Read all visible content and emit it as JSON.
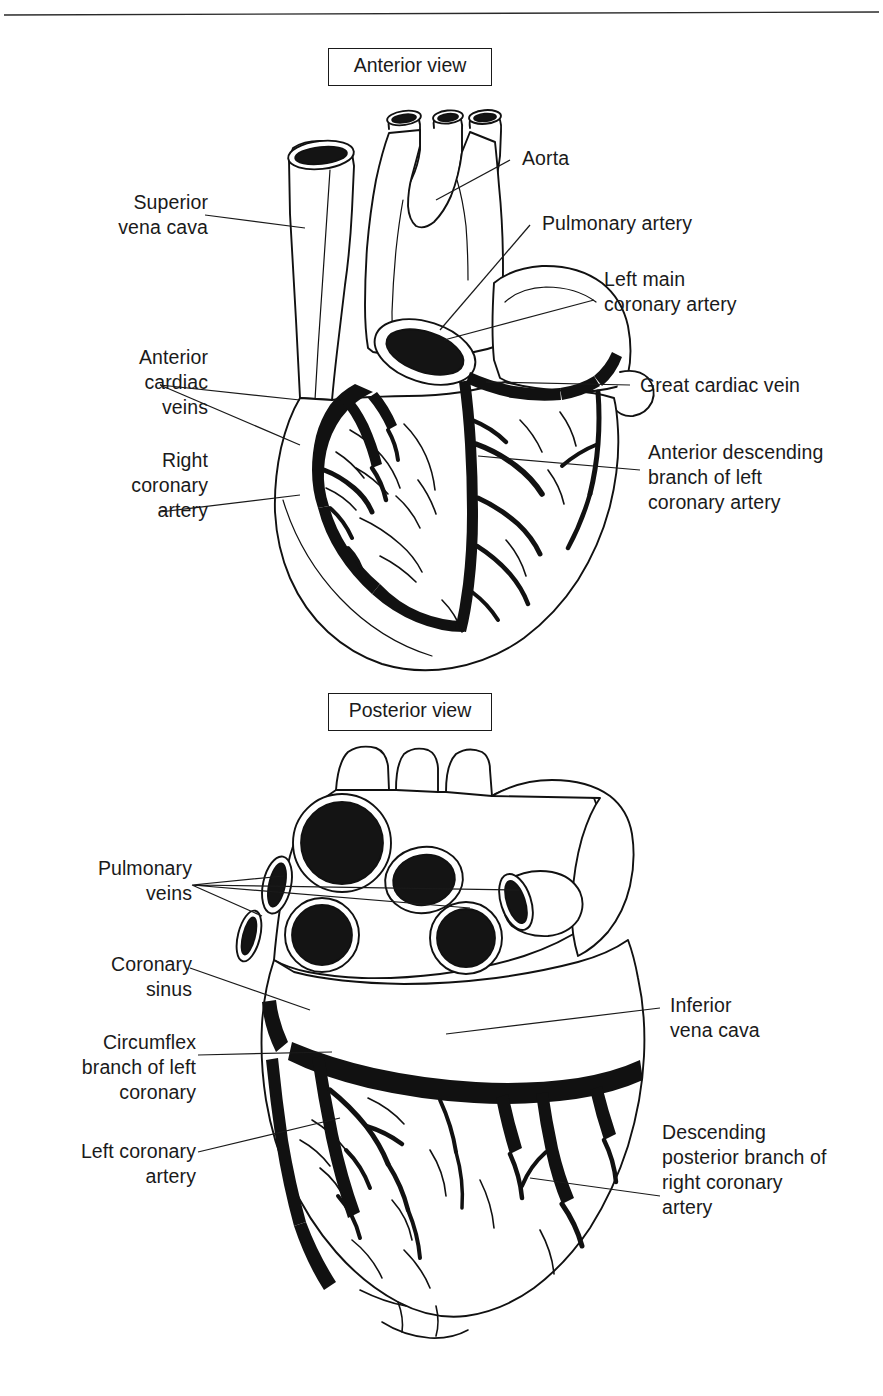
{
  "figure": {
    "background_color": "#ffffff",
    "ink_color": "#111111",
    "top_rule": true
  },
  "panels": [
    {
      "id": "anterior",
      "view_title": "Anterior view",
      "labels": [
        {
          "id": "superior-vena-cava",
          "text": "Superior\nvena cava",
          "side": "left"
        },
        {
          "id": "anterior-cardiac-veins",
          "text": "Anterior\ncardiac\nveins",
          "side": "left"
        },
        {
          "id": "right-coronary-artery",
          "text": "Right\ncoronary\nartery",
          "side": "left"
        },
        {
          "id": "aorta",
          "text": "Aorta",
          "side": "right"
        },
        {
          "id": "pulmonary-artery",
          "text": "Pulmonary artery",
          "side": "right"
        },
        {
          "id": "left-main-coronary-artery",
          "text": "Left main\ncoronary artery",
          "side": "right"
        },
        {
          "id": "great-cardiac-vein",
          "text": "Great cardiac vein",
          "side": "right"
        },
        {
          "id": "anterior-descending-branch",
          "text": "Anterior descending\nbranch of left\ncoronary artery",
          "side": "right"
        }
      ]
    },
    {
      "id": "posterior",
      "view_title": "Posterior view",
      "labels": [
        {
          "id": "pulmonary-veins",
          "text": "Pulmonary\nveins",
          "side": "left"
        },
        {
          "id": "coronary-sinus",
          "text": "Coronary\nsinus",
          "side": "left"
        },
        {
          "id": "circumflex-branch",
          "text": "Circumflex\nbranch of left\ncoronary",
          "side": "left"
        },
        {
          "id": "left-coronary-artery",
          "text": "Left coronary\nartery",
          "side": "left"
        },
        {
          "id": "inferior-vena-cava",
          "text": "Inferior\nvena cava",
          "side": "right"
        },
        {
          "id": "descending-posterior-branch",
          "text": "Descending\nposterior branch of\nright coronary\nartery",
          "side": "right"
        }
      ]
    }
  ]
}
